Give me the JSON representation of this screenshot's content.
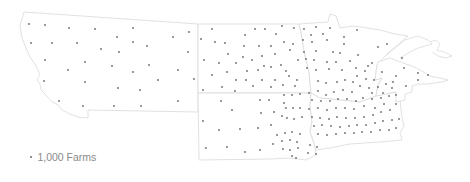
{
  "map": {
    "type": "dot-density",
    "states": [
      "Montana",
      "North Dakota",
      "South Dakota",
      "Minnesota",
      "Iowa",
      "Wisconsin"
    ],
    "colors": {
      "dot": "#6b6b6b",
      "border": "#d9d9d9",
      "background": "#ffffff"
    }
  },
  "legend": {
    "label": "1,000 Farms",
    "dot_value": 1000
  },
  "dots": [
    [
      29,
      24
    ],
    [
      45,
      25
    ],
    [
      69,
      28
    ],
    [
      95,
      29
    ],
    [
      133,
      28
    ],
    [
      189,
      32
    ],
    [
      117,
      37
    ],
    [
      173,
      37
    ],
    [
      31,
      43
    ],
    [
      52,
      43
    ],
    [
      77,
      43
    ],
    [
      133,
      42
    ],
    [
      147,
      46
    ],
    [
      101,
      49
    ],
    [
      119,
      52
    ],
    [
      188,
      52
    ],
    [
      45,
      60
    ],
    [
      85,
      62
    ],
    [
      112,
      66
    ],
    [
      149,
      65
    ],
    [
      68,
      70
    ],
    [
      133,
      72
    ],
    [
      178,
      70
    ],
    [
      194,
      79
    ],
    [
      44,
      81
    ],
    [
      85,
      82
    ],
    [
      118,
      88
    ],
    [
      158,
      80
    ],
    [
      140,
      90
    ],
    [
      59,
      101
    ],
    [
      83,
      106
    ],
    [
      114,
      106
    ],
    [
      141,
      106
    ],
    [
      178,
      101
    ],
    [
      212,
      29
    ],
    [
      201,
      39
    ],
    [
      215,
      42
    ],
    [
      225,
      43
    ],
    [
      245,
      35
    ],
    [
      255,
      29
    ],
    [
      265,
      29
    ],
    [
      276,
      34
    ],
    [
      282,
      26
    ],
    [
      294,
      28
    ],
    [
      244,
      46
    ],
    [
      259,
      46
    ],
    [
      271,
      46
    ],
    [
      284,
      42
    ],
    [
      293,
      44
    ],
    [
      228,
      54
    ],
    [
      243,
      57
    ],
    [
      262,
      56
    ],
    [
      275,
      54
    ],
    [
      290,
      50
    ],
    [
      204,
      60
    ],
    [
      219,
      63
    ],
    [
      236,
      63
    ],
    [
      252,
      60
    ],
    [
      264,
      66
    ],
    [
      281,
      65
    ],
    [
      298,
      60
    ],
    [
      227,
      72
    ],
    [
      247,
      71
    ],
    [
      258,
      70
    ],
    [
      271,
      67
    ],
    [
      286,
      71
    ],
    [
      212,
      75
    ],
    [
      236,
      80
    ],
    [
      246,
      80
    ],
    [
      262,
      80
    ],
    [
      275,
      80
    ],
    [
      289,
      76
    ],
    [
      297,
      80
    ],
    [
      203,
      90
    ],
    [
      222,
      87
    ],
    [
      235,
      91
    ],
    [
      253,
      86
    ],
    [
      271,
      87
    ],
    [
      283,
      85
    ],
    [
      295,
      86
    ],
    [
      304,
      29
    ],
    [
      316,
      27
    ],
    [
      330,
      28
    ],
    [
      311,
      35
    ],
    [
      323,
      34
    ],
    [
      303,
      40
    ],
    [
      312,
      42
    ],
    [
      327,
      40
    ],
    [
      344,
      37
    ],
    [
      357,
      30
    ],
    [
      378,
      47
    ],
    [
      304,
      52
    ],
    [
      316,
      51
    ],
    [
      333,
      52
    ],
    [
      344,
      44
    ],
    [
      340,
      53
    ],
    [
      306,
      59
    ],
    [
      314,
      60
    ],
    [
      327,
      62
    ],
    [
      336,
      62
    ],
    [
      350,
      61
    ],
    [
      358,
      55
    ],
    [
      368,
      66
    ],
    [
      307,
      68
    ],
    [
      316,
      70
    ],
    [
      329,
      69
    ],
    [
      342,
      70
    ],
    [
      356,
      68
    ],
    [
      365,
      71
    ],
    [
      372,
      63
    ],
    [
      387,
      44
    ],
    [
      402,
      58
    ],
    [
      404,
      68
    ],
    [
      382,
      72
    ],
    [
      396,
      76
    ],
    [
      418,
      80
    ],
    [
      406,
      86
    ],
    [
      418,
      73
    ],
    [
      428,
      75
    ],
    [
      221,
      101
    ],
    [
      232,
      110
    ],
    [
      203,
      121
    ],
    [
      219,
      130
    ],
    [
      240,
      129
    ],
    [
      206,
      148
    ],
    [
      227,
      147
    ],
    [
      245,
      152
    ],
    [
      260,
      100
    ],
    [
      269,
      100
    ],
    [
      261,
      113
    ],
    [
      274,
      112
    ],
    [
      284,
      103
    ],
    [
      258,
      128
    ],
    [
      271,
      125
    ],
    [
      282,
      116
    ],
    [
      273,
      144
    ],
    [
      260,
      150
    ],
    [
      284,
      95
    ],
    [
      292,
      95
    ],
    [
      300,
      94
    ],
    [
      286,
      108
    ],
    [
      293,
      108
    ],
    [
      300,
      108
    ],
    [
      287,
      118
    ],
    [
      294,
      119
    ],
    [
      302,
      117
    ],
    [
      277,
      135
    ],
    [
      285,
      133
    ],
    [
      292,
      132
    ],
    [
      300,
      134
    ],
    [
      282,
      141
    ],
    [
      290,
      140
    ],
    [
      297,
      142
    ],
    [
      283,
      149
    ],
    [
      290,
      150
    ],
    [
      298,
      148
    ],
    [
      310,
      145
    ],
    [
      317,
      147
    ],
    [
      308,
      153
    ],
    [
      316,
      154
    ],
    [
      292,
      156
    ],
    [
      296,
      158
    ],
    [
      309,
      93
    ],
    [
      318,
      91
    ],
    [
      326,
      95
    ],
    [
      334,
      92
    ],
    [
      343,
      90
    ],
    [
      352,
      92
    ],
    [
      312,
      100
    ],
    [
      321,
      101
    ],
    [
      330,
      101
    ],
    [
      338,
      99
    ],
    [
      347,
      99
    ],
    [
      356,
      101
    ],
    [
      309,
      109
    ],
    [
      318,
      108
    ],
    [
      327,
      110
    ],
    [
      336,
      108
    ],
    [
      345,
      108
    ],
    [
      354,
      109
    ],
    [
      364,
      106
    ],
    [
      312,
      117
    ],
    [
      320,
      118
    ],
    [
      329,
      119
    ],
    [
      337,
      117
    ],
    [
      346,
      118
    ],
    [
      355,
      118
    ],
    [
      364,
      117
    ],
    [
      373,
      115
    ],
    [
      381,
      112
    ],
    [
      390,
      110
    ],
    [
      396,
      104
    ],
    [
      314,
      126
    ],
    [
      322,
      125
    ],
    [
      331,
      126
    ],
    [
      340,
      127
    ],
    [
      349,
      126
    ],
    [
      357,
      125
    ],
    [
      366,
      125
    ],
    [
      375,
      123
    ],
    [
      383,
      121
    ],
    [
      392,
      120
    ],
    [
      399,
      119
    ],
    [
      318,
      134
    ],
    [
      327,
      135
    ],
    [
      336,
      134
    ],
    [
      345,
      133
    ],
    [
      354,
      133
    ],
    [
      362,
      132
    ],
    [
      371,
      132
    ],
    [
      380,
      130
    ],
    [
      389,
      130
    ],
    [
      396,
      128
    ],
    [
      360,
      86
    ],
    [
      369,
      88
    ],
    [
      378,
      87
    ],
    [
      386,
      84
    ],
    [
      393,
      82
    ],
    [
      372,
      99
    ],
    [
      381,
      98
    ],
    [
      389,
      96
    ],
    [
      396,
      95
    ],
    [
      384,
      104
    ],
    [
      375,
      108
    ],
    [
      363,
      98
    ],
    [
      392,
      88
    ],
    [
      337,
      82
    ],
    [
      345,
      80
    ],
    [
      353,
      82
    ],
    [
      318,
      81
    ],
    [
      326,
      83
    ],
    [
      357,
      76
    ],
    [
      366,
      79
    ],
    [
      374,
      80
    ],
    [
      383,
      93
    ],
    [
      372,
      93
    ]
  ]
}
